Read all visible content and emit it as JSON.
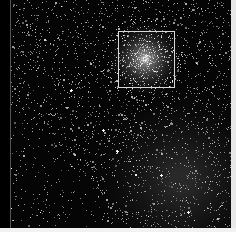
{
  "figure": {
    "side_label": "",
    "background_color": "#000000",
    "star_field": {
      "seed": 7,
      "star_count": 2600,
      "cluster_core": {
        "x": 134,
        "y": 59,
        "radius": 42
      },
      "dark_lane": {
        "x0": 0,
        "y0": 110,
        "x1": 120,
        "y1": 228
      },
      "bright_region": {
        "x0": 110,
        "y0": 100,
        "x1": 220,
        "y1": 228
      }
    },
    "highlight_box": {
      "left": 118,
      "top": 31,
      "width": 57,
      "height": 57,
      "color": "#d8d8d8"
    }
  }
}
